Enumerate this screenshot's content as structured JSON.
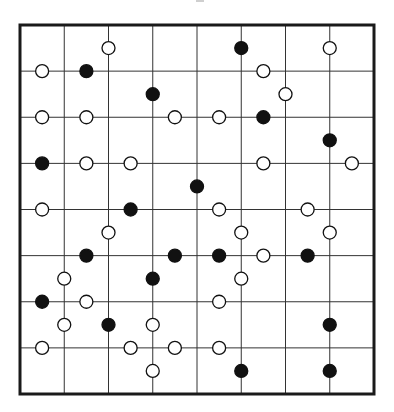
{
  "diagram": {
    "type": "grid-with-circles",
    "canvas": {
      "width": 394,
      "height": 412
    },
    "frame": {
      "left": 20,
      "top": 25,
      "right": 374,
      "bottom": 394,
      "stroke": "#1a1a1a",
      "stroke_width": 3
    },
    "grid": {
      "columns": 8,
      "rows": 8,
      "line_color": "#333333",
      "line_width": 1
    },
    "half_step_units": {
      "cols": 16,
      "rows": 16,
      "note": "circle positions given in half-cell units (c,r) from top-left of frame"
    },
    "colors": {
      "filled": "#111111",
      "open_fill": "#ffffff",
      "open_stroke": "#111111",
      "background": "#ffffff"
    },
    "circle_radius": 6.5,
    "circles": [
      {
        "c": 4,
        "r": 1,
        "filled": false
      },
      {
        "c": 10,
        "r": 1,
        "filled": true
      },
      {
        "c": 14,
        "r": 1,
        "filled": false
      },
      {
        "c": 1,
        "r": 2,
        "filled": false
      },
      {
        "c": 3,
        "r": 2,
        "filled": true
      },
      {
        "c": 11,
        "r": 2,
        "filled": false
      },
      {
        "c": 6,
        "r": 3,
        "filled": true
      },
      {
        "c": 12,
        "r": 3,
        "filled": false
      },
      {
        "c": 1,
        "r": 4,
        "filled": false
      },
      {
        "c": 3,
        "r": 4,
        "filled": false
      },
      {
        "c": 7,
        "r": 4,
        "filled": false
      },
      {
        "c": 9,
        "r": 4,
        "filled": false
      },
      {
        "c": 11,
        "r": 4,
        "filled": true
      },
      {
        "c": 14,
        "r": 5,
        "filled": true
      },
      {
        "c": 1,
        "r": 6,
        "filled": true
      },
      {
        "c": 3,
        "r": 6,
        "filled": false
      },
      {
        "c": 5,
        "r": 6,
        "filled": false
      },
      {
        "c": 11,
        "r": 6,
        "filled": false
      },
      {
        "c": 15,
        "r": 6,
        "filled": false
      },
      {
        "c": 8,
        "r": 7,
        "filled": true
      },
      {
        "c": 1,
        "r": 8,
        "filled": false
      },
      {
        "c": 5,
        "r": 8,
        "filled": true
      },
      {
        "c": 9,
        "r": 8,
        "filled": false
      },
      {
        "c": 13,
        "r": 8,
        "filled": false
      },
      {
        "c": 4,
        "r": 9,
        "filled": false
      },
      {
        "c": 10,
        "r": 9,
        "filled": false
      },
      {
        "c": 14,
        "r": 9,
        "filled": false
      },
      {
        "c": 3,
        "r": 10,
        "filled": true
      },
      {
        "c": 7,
        "r": 10,
        "filled": true
      },
      {
        "c": 9,
        "r": 10,
        "filled": true
      },
      {
        "c": 11,
        "r": 10,
        "filled": false
      },
      {
        "c": 13,
        "r": 10,
        "filled": true
      },
      {
        "c": 2,
        "r": 11,
        "filled": false
      },
      {
        "c": 6,
        "r": 11,
        "filled": true
      },
      {
        "c": 10,
        "r": 11,
        "filled": false
      },
      {
        "c": 1,
        "r": 12,
        "filled": true
      },
      {
        "c": 3,
        "r": 12,
        "filled": false
      },
      {
        "c": 9,
        "r": 12,
        "filled": false
      },
      {
        "c": 2,
        "r": 13,
        "filled": false
      },
      {
        "c": 4,
        "r": 13,
        "filled": true
      },
      {
        "c": 6,
        "r": 13,
        "filled": false
      },
      {
        "c": 14,
        "r": 13,
        "filled": true
      },
      {
        "c": 1,
        "r": 14,
        "filled": false
      },
      {
        "c": 5,
        "r": 14,
        "filled": false
      },
      {
        "c": 7,
        "r": 14,
        "filled": false
      },
      {
        "c": 9,
        "r": 14,
        "filled": false
      },
      {
        "c": 6,
        "r": 15,
        "filled": false
      },
      {
        "c": 10,
        "r": 15,
        "filled": true
      },
      {
        "c": 14,
        "r": 15,
        "filled": true
      }
    ],
    "counts": {
      "filled": 20,
      "open": 29,
      "total": 49
    }
  }
}
